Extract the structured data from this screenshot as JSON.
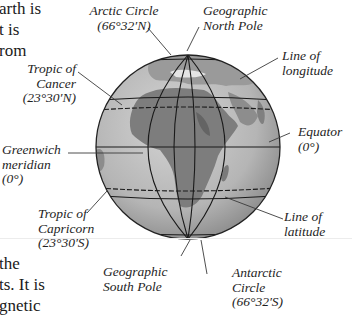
{
  "body_text": {
    "top_fragments": [
      "arth is",
      "t is",
      "rom"
    ],
    "bottom_fragments": [
      "the",
      "ts. It is",
      "gnetic"
    ]
  },
  "labels": {
    "arctic_circle": {
      "line1": "Arctic Circle",
      "line2": "(66°32′N)"
    },
    "north_pole": {
      "line1": "Geographic",
      "line2": "North Pole"
    },
    "line_of_longitude": {
      "line1": "Line of",
      "line2": "longitude"
    },
    "tropic_of_cancer": {
      "line1": "Tropic of",
      "line2": "Cancer",
      "line3": "(23°30′N)"
    },
    "equator": {
      "line1": "Equator",
      "line2": "(0°)"
    },
    "greenwich_meridian": {
      "line1": "Greenwich",
      "line2": "meridian",
      "line3": "(0°)"
    },
    "tropic_of_capricorn": {
      "line1": "Tropic of",
      "line2": "Capricorn",
      "line3": "(23°30′S)"
    },
    "line_of_latitude": {
      "line1": "Line of",
      "line2": "latitude"
    },
    "south_pole": {
      "line1": "Geographic",
      "line2": "South Pole"
    },
    "antarctic_circle": {
      "line1": "Antarctic",
      "line2": "Circle",
      "line3": "(66°32′S)"
    }
  },
  "colors": {
    "globe_ocean": "#b9b9b9",
    "globe_land": "#8a8a8a",
    "grid_line": "#1a1a1a",
    "leader_line": "#3a3a3a"
  }
}
